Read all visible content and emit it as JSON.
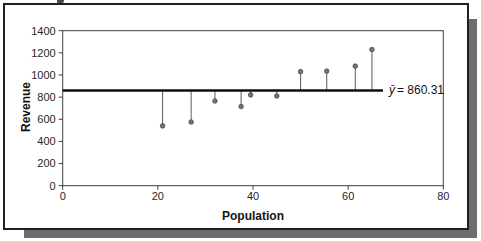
{
  "chart_data": {
    "type": "scatter",
    "title": "",
    "xlabel": "Population",
    "ylabel": "Revenue",
    "x": [
      21,
      27,
      32,
      37.5,
      39.5,
      45,
      50,
      55.5,
      61.5,
      65
    ],
    "y": [
      540,
      575,
      765,
      715,
      820,
      810,
      1030,
      1035,
      1080,
      1230
    ],
    "xlim": [
      0,
      80
    ],
    "ylim": [
      0,
      1400
    ],
    "x_ticks": [
      0,
      20,
      40,
      60,
      80
    ],
    "y_ticks": [
      0,
      200,
      400,
      600,
      800,
      1000,
      1200,
      1400
    ],
    "grid": false,
    "legend": false,
    "mean_label": {
      "symbol": "ȳ",
      "text": "= 860.31",
      "value": 860.31
    },
    "colors": {
      "marker": "#747474",
      "marker_edge": "#3f3f3f",
      "stem": "#5a5a5a",
      "mean_line": "#0f0f0f",
      "axis": "#3f3f3f",
      "tick_text": "#262626",
      "frame_border": "#1f1f1f",
      "shadow": "#6e6e6e"
    }
  }
}
